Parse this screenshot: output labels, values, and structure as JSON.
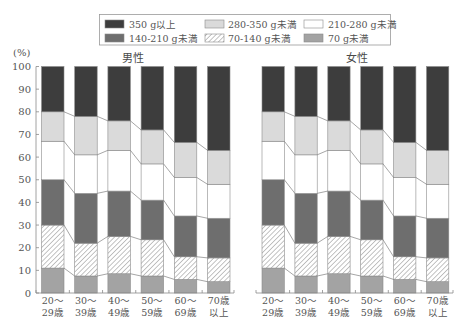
{
  "legend": {
    "items": [
      {
        "label": "350 g以上",
        "series_index": 5
      },
      {
        "label": "280-350 g未満",
        "series_index": 4
      },
      {
        "label": "210-280 g未満",
        "series_index": 3
      },
      {
        "label": "140-210 g未満",
        "series_index": 2
      },
      {
        "label": "70-140 g未満",
        "series_index": 1
      },
      {
        "label": "70 g未満",
        "series_index": 0
      }
    ]
  },
  "y_unit_label": "(%)",
  "colors": {
    "text": "#555555",
    "outline": "#8a8a8a",
    "connector": "#808080",
    "hatch_line": "#7a7a7a"
  },
  "chart_data": [
    {
      "type": "bar",
      "stacked": true,
      "title": "男性",
      "xlabel": "",
      "ylabel": "(%)",
      "ylim": [
        0,
        100
      ],
      "yticks": [
        0,
        10,
        20,
        30,
        40,
        50,
        60,
        70,
        80,
        90,
        100
      ],
      "grid": false,
      "legend_position": "top",
      "categories": [
        [
          "20～",
          "29歳"
        ],
        [
          "30～",
          "39歳"
        ],
        [
          "40～",
          "49歳"
        ],
        [
          "50～",
          "59歳"
        ],
        [
          "60～",
          "69歳"
        ],
        [
          "70歳",
          "以上"
        ]
      ],
      "series": [
        {
          "name": "70 g未満",
          "color": "#a3a3a3",
          "values": [
            11,
            7.5,
            8.5,
            7.5,
            6,
            5
          ]
        },
        {
          "name": "70-140 g未満",
          "color": "hatch",
          "values": [
            19,
            14.5,
            16.5,
            16,
            10,
            10.5
          ]
        },
        {
          "name": "140-210 g未満",
          "color": "#6e6e6e",
          "values": [
            20,
            22,
            20,
            17.5,
            18,
            17.5
          ]
        },
        {
          "name": "210-280 g未満",
          "color": "#ffffff",
          "values": [
            17,
            17,
            18,
            16,
            17,
            15
          ]
        },
        {
          "name": "280-350 g未満",
          "color": "#dadada",
          "values": [
            13,
            17,
            13,
            15,
            15.5,
            15
          ]
        },
        {
          "name": "350 g以上",
          "color": "#3d3d3d",
          "values": [
            20,
            22,
            24,
            28,
            33.5,
            37
          ]
        }
      ]
    },
    {
      "type": "bar",
      "stacked": true,
      "title": "女性",
      "xlabel": "",
      "ylabel": "(%)",
      "ylim": [
        0,
        100
      ],
      "yticks": [
        0,
        10,
        20,
        30,
        40,
        50,
        60,
        70,
        80,
        90,
        100
      ],
      "grid": false,
      "legend_position": "top",
      "categories": [
        [
          "20～",
          "29歳"
        ],
        [
          "30～",
          "39歳"
        ],
        [
          "40～",
          "49歳"
        ],
        [
          "50～",
          "59歳"
        ],
        [
          "60～",
          "69歳"
        ],
        [
          "70歳",
          "以上"
        ]
      ],
      "series": [
        {
          "name": "70 g未満",
          "color": "#a3a3a3",
          "values": [
            11,
            7.5,
            8.5,
            7.5,
            6,
            5
          ]
        },
        {
          "name": "70-140 g未満",
          "color": "hatch",
          "values": [
            19,
            14.5,
            16.5,
            16,
            10,
            10.5
          ]
        },
        {
          "name": "140-210 g未満",
          "color": "#6e6e6e",
          "values": [
            20,
            22,
            20,
            17.5,
            18,
            17.5
          ]
        },
        {
          "name": "210-280 g未満",
          "color": "#ffffff",
          "values": [
            17,
            17,
            18,
            16,
            17,
            15
          ]
        },
        {
          "name": "280-350 g未満",
          "color": "#dadada",
          "values": [
            13,
            17,
            13,
            15,
            15.5,
            15
          ]
        },
        {
          "name": "350 g以上",
          "color": "#3d3d3d",
          "values": [
            20,
            22,
            24,
            28,
            33.5,
            37
          ]
        }
      ]
    }
  ]
}
